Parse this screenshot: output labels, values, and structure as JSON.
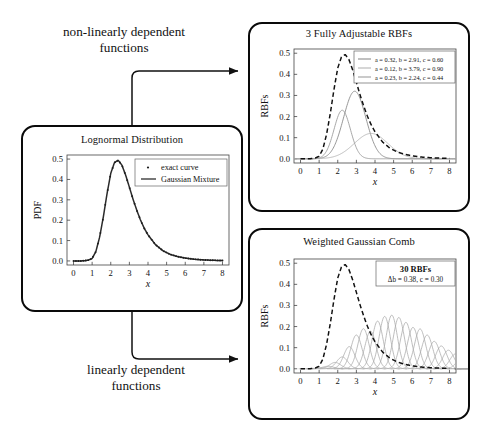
{
  "figure": {
    "flow_labels": {
      "top": "non-linearly dependent\nfunctions",
      "bottom": "linearly dependent\nfunctions"
    }
  },
  "chart_data": [
    {
      "panel": "left",
      "type": "line",
      "title": "Lognormal Distribution",
      "xlabel": "x",
      "ylabel": "PDF",
      "xlim": [
        -0.35,
        8.35
      ],
      "ylim": [
        -0.02,
        0.52
      ],
      "xticks": [
        "0",
        "1",
        "2",
        "3",
        "4",
        "5",
        "6",
        "7",
        "8"
      ],
      "yticks": [
        "0.0",
        "0.1",
        "0.2",
        "0.3",
        "0.4",
        "0.5"
      ],
      "grid": false,
      "legend_position": "upper right",
      "legend": [
        {
          "label": "exact curve",
          "marker": "dot",
          "color": "#2b2b2b"
        },
        {
          "label": "Gaussian Mixture",
          "marker": "line",
          "color": "#2b2b2b"
        }
      ],
      "series": [
        {
          "name": "Gaussian Mixture",
          "style": "solid",
          "color": "#2b2b2b",
          "x": [
            0.0,
            0.2,
            0.4,
            0.6,
            0.8,
            1.0,
            1.2,
            1.4,
            1.6,
            1.8,
            2.0,
            2.2,
            2.4,
            2.6,
            2.8,
            3.0,
            3.2,
            3.4,
            3.6,
            3.8,
            4.0,
            4.4,
            4.8,
            5.2,
            5.6,
            6.0,
            6.5,
            7.0,
            7.5,
            8.0
          ],
          "y": [
            0.0,
            0.0,
            0.0,
            0.001,
            0.004,
            0.012,
            0.046,
            0.116,
            0.215,
            0.33,
            0.43,
            0.483,
            0.494,
            0.47,
            0.421,
            0.362,
            0.302,
            0.248,
            0.2,
            0.16,
            0.128,
            0.08,
            0.05,
            0.032,
            0.021,
            0.014,
            0.008,
            0.005,
            0.003,
            0.002
          ]
        },
        {
          "name": "exact curve",
          "style": "markers",
          "color": "#2b2b2b"
        }
      ]
    },
    {
      "panel": "top-right",
      "type": "line",
      "title": "3 Fully Adjustable RBFs",
      "xlabel": "x",
      "ylabel": "RBFs",
      "xlim": [
        -0.35,
        8.35
      ],
      "ylim": [
        -0.02,
        0.52
      ],
      "xticks": [
        "0",
        "1",
        "2",
        "3",
        "4",
        "5",
        "6",
        "7",
        "8"
      ],
      "yticks": [
        "0.0",
        "0.1",
        "0.2",
        "0.3",
        "0.4",
        "0.5"
      ],
      "grid": false,
      "legend_position": "upper right",
      "legend": [
        {
          "label": "a = 0.32, b = 2.91, c = 0.60",
          "color": "#8c8c8c"
        },
        {
          "label": "a = 0.12, b = 3.79, c = 0.90",
          "color": "#b5b5b5"
        },
        {
          "label": "a = 0.23, b = 2.24, c = 0.44",
          "color": "#9e9e9e"
        }
      ],
      "rbfs": [
        {
          "a": 0.32,
          "b": 2.91,
          "c": 0.6,
          "color": "#8c8c8c"
        },
        {
          "a": 0.12,
          "b": 3.79,
          "c": 0.9,
          "color": "#b5b5b5"
        },
        {
          "a": 0.23,
          "b": 2.24,
          "c": 0.44,
          "color": "#9e9e9e"
        }
      ],
      "envelope": {
        "name": "target",
        "style": "dashed",
        "color": "#111111",
        "x": [
          0.0,
          0.2,
          0.4,
          0.6,
          0.8,
          1.0,
          1.2,
          1.4,
          1.6,
          1.8,
          2.0,
          2.2,
          2.4,
          2.6,
          2.8,
          3.0,
          3.2,
          3.4,
          3.6,
          3.8,
          4.0,
          4.4,
          4.8,
          5.2,
          5.6,
          6.0,
          6.5,
          7.0,
          7.5,
          8.0
        ],
        "y": [
          0.0,
          0.0,
          0.0,
          0.001,
          0.004,
          0.012,
          0.046,
          0.116,
          0.215,
          0.33,
          0.43,
          0.483,
          0.494,
          0.47,
          0.421,
          0.362,
          0.302,
          0.248,
          0.2,
          0.16,
          0.128,
          0.08,
          0.05,
          0.032,
          0.021,
          0.014,
          0.008,
          0.005,
          0.003,
          0.002
        ]
      }
    },
    {
      "panel": "bottom-right",
      "type": "line",
      "title": "Weighted Gaussian Comb",
      "xlabel": "x",
      "ylabel": "RBFs",
      "xlim": [
        -0.35,
        8.35
      ],
      "ylim": [
        -0.02,
        0.52
      ],
      "xticks": [
        "0",
        "1",
        "2",
        "3",
        "4",
        "5",
        "6",
        "7",
        "8"
      ],
      "yticks": [
        "0.0",
        "0.1",
        "0.2",
        "0.3",
        "0.4",
        "0.5"
      ],
      "grid": false,
      "annotation": {
        "line1": "30 RBFs",
        "line2": "Δb = 0.38, c = 0.30",
        "position": "upper right"
      },
      "comb": {
        "count": 30,
        "delta_b": 0.38,
        "c": 0.3,
        "b_start": 1.1,
        "amplitudes": [
          0.004,
          0.012,
          0.03,
          0.056,
          0.105,
          0.16,
          0.19,
          0.178,
          0.226,
          0.248,
          0.254,
          0.243,
          0.22,
          0.196,
          0.189,
          0.16,
          0.13,
          0.108,
          0.088,
          0.07,
          0.056,
          0.06,
          0.044,
          0.032,
          0.024,
          0.017,
          0.012,
          0.008,
          0.005,
          0.003
        ],
        "color": "#a8a8a8"
      },
      "envelope": {
        "name": "target",
        "style": "dashed",
        "color": "#111111",
        "x": [
          0.0,
          0.2,
          0.4,
          0.6,
          0.8,
          1.0,
          1.2,
          1.4,
          1.6,
          1.8,
          2.0,
          2.2,
          2.4,
          2.6,
          2.8,
          3.0,
          3.2,
          3.4,
          3.6,
          3.8,
          4.0,
          4.4,
          4.8,
          5.2,
          5.6,
          6.0,
          6.5,
          7.0,
          7.5,
          8.0
        ],
        "y": [
          0.0,
          0.0,
          0.0,
          0.001,
          0.004,
          0.012,
          0.046,
          0.116,
          0.215,
          0.33,
          0.43,
          0.483,
          0.494,
          0.47,
          0.421,
          0.362,
          0.302,
          0.248,
          0.2,
          0.16,
          0.128,
          0.08,
          0.05,
          0.032,
          0.021,
          0.014,
          0.008,
          0.005,
          0.003,
          0.002
        ]
      }
    }
  ]
}
